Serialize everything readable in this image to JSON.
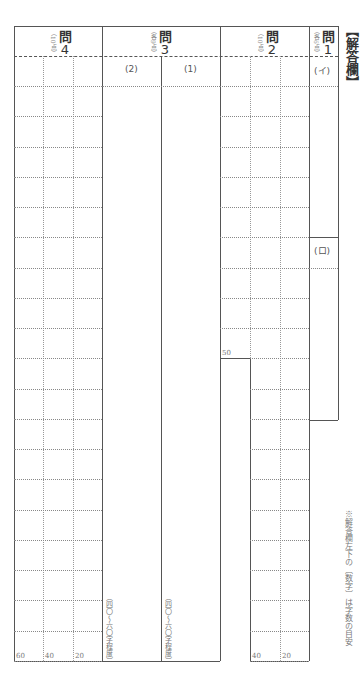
{
  "sheet": {
    "title": "【解答欄】",
    "note": "※解答欄左下の〔数字〕は字数の目安"
  },
  "questions": [
    {
      "id": "q4",
      "label": "問",
      "number": "4",
      "points": "（10点）",
      "counts": [
        "60",
        "40",
        "20"
      ]
    },
    {
      "id": "q3",
      "label": "問",
      "number": "3",
      "points": "（各9点）",
      "parts": [
        {
          "label": "(2)",
          "length_note": "（四〇～六〇字程度）"
        },
        {
          "label": "(1)",
          "length_note": "（四〇～六〇字程度）"
        }
      ]
    },
    {
      "id": "q2",
      "label": "問",
      "number": "2",
      "points": "（10点）",
      "counts": [
        "50",
        "40",
        "20"
      ]
    },
    {
      "id": "q1",
      "label": "問",
      "number": "1",
      "points": "（各6点）",
      "parts": [
        {
          "label": "(イ)"
        },
        {
          "label": "(ロ)"
        }
      ]
    }
  ]
}
